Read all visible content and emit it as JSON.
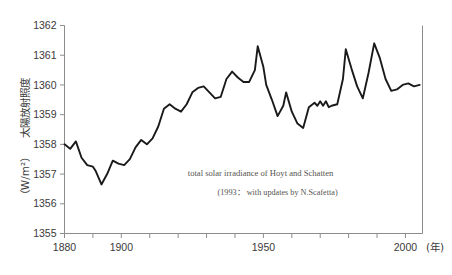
{
  "chart_data": {
    "type": "line",
    "title": "",
    "xlabel": "(年)",
    "ylabel": "太陽放射照度（W/m²）",
    "ylabel_main": "太陽放射照度",
    "ylabel_unit": "（W/m²）",
    "xlim": [
      1880,
      2006
    ],
    "ylim": [
      1355,
      1362
    ],
    "grid": false,
    "legend": "none",
    "y_ticks": [
      1355,
      1356,
      1357,
      1358,
      1359,
      1360,
      1361,
      1362
    ],
    "y_tick_labels": [
      "1355",
      "1356",
      "1357",
      "1358",
      "1359",
      "1360",
      "1361",
      "1362"
    ],
    "x_ticks": [
      1880,
      1890,
      1900,
      1910,
      1920,
      1930,
      1940,
      1950,
      1960,
      1970,
      1980,
      1990,
      2000
    ],
    "x_tick_labels": [
      "1880",
      "",
      "1900",
      "",
      "",
      "",
      "",
      "1950",
      "",
      "",
      "",
      "",
      "2000"
    ],
    "series": [
      {
        "name": "total solar irradiance",
        "color": "#1a1a1a",
        "x": [
          1880,
          1882,
          1884,
          1886,
          1888,
          1890,
          1891,
          1893,
          1895,
          1897,
          1899,
          1901,
          1903,
          1905,
          1907,
          1909,
          1911,
          1913,
          1915,
          1917,
          1919,
          1921,
          1923,
          1925,
          1927,
          1929,
          1931,
          1933,
          1935,
          1937,
          1939,
          1941,
          1943,
          1945,
          1947,
          1948,
          1950,
          1951,
          1953,
          1955,
          1957,
          1958,
          1960,
          1962,
          1964,
          1966,
          1968,
          1969,
          1970,
          1971,
          1972,
          1973,
          1974,
          1976,
          1978,
          1979,
          1981,
          1983,
          1985,
          1987,
          1989,
          1991,
          1993,
          1995,
          1997,
          1999,
          2001,
          2003,
          2005
        ],
        "values": [
          1358.0,
          1357.85,
          1358.1,
          1357.55,
          1357.3,
          1357.25,
          1357.1,
          1356.65,
          1357.0,
          1357.45,
          1357.35,
          1357.3,
          1357.5,
          1357.9,
          1358.15,
          1358.0,
          1358.2,
          1358.6,
          1359.2,
          1359.35,
          1359.2,
          1359.1,
          1359.35,
          1359.75,
          1359.9,
          1359.95,
          1359.75,
          1359.55,
          1359.6,
          1360.2,
          1360.45,
          1360.25,
          1360.1,
          1360.1,
          1360.5,
          1361.3,
          1360.6,
          1360.0,
          1359.5,
          1358.95,
          1359.3,
          1359.75,
          1359.1,
          1358.7,
          1358.55,
          1359.25,
          1359.4,
          1359.3,
          1359.45,
          1359.3,
          1359.45,
          1359.25,
          1359.3,
          1359.35,
          1360.2,
          1361.2,
          1360.55,
          1359.95,
          1359.55,
          1360.4,
          1361.4,
          1360.9,
          1360.2,
          1359.8,
          1359.85,
          1360.0,
          1360.05,
          1359.95,
          1360.0
        ]
      }
    ],
    "annotations": [
      {
        "text": "total solar irradiance of Hoyt and Schatten",
        "x": 1949,
        "y": 1356.95
      },
      {
        "text": "(1993： with updates by N.Scafetta)",
        "x": 1955,
        "y": 1356.3
      }
    ]
  },
  "figure": {
    "background": "#ffffff",
    "axis_color": "#8c8c8c",
    "line_color": "#1a1a1a"
  }
}
